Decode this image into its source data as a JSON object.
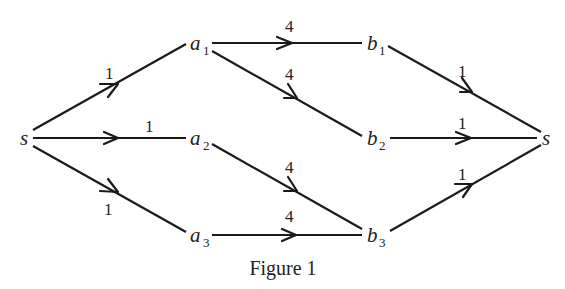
{
  "figure": {
    "caption": "Figure 1",
    "nodes": [
      {
        "id": "s_left",
        "name": "s",
        "sub": "",
        "x": 25,
        "y": 138
      },
      {
        "id": "a1",
        "name": "a",
        "sub": "1",
        "x": 193,
        "y": 43
      },
      {
        "id": "a2",
        "name": "a",
        "sub": "2",
        "x": 193,
        "y": 138
      },
      {
        "id": "a3",
        "name": "a",
        "sub": "3",
        "x": 193,
        "y": 235
      },
      {
        "id": "b1",
        "name": "b",
        "sub": "1",
        "x": 368,
        "y": 43
      },
      {
        "id": "b2",
        "name": "b",
        "sub": "2",
        "x": 368,
        "y": 138
      },
      {
        "id": "b3",
        "name": "b",
        "sub": "3",
        "x": 368,
        "y": 235
      },
      {
        "id": "s_right",
        "name": "s",
        "sub": "",
        "x": 545,
        "y": 138
      }
    ],
    "edges": [
      {
        "from": "s_left",
        "to": "a1",
        "weight": "1"
      },
      {
        "from": "s_left",
        "to": "a2",
        "weight": "1"
      },
      {
        "from": "s_left",
        "to": "a3",
        "weight": "1"
      },
      {
        "from": "a1",
        "to": "b1",
        "weight": "4"
      },
      {
        "from": "a1",
        "to": "b2",
        "weight": "4"
      },
      {
        "from": "a2",
        "to": "b3",
        "weight": "4"
      },
      {
        "from": "a3",
        "to": "b3",
        "weight": "4"
      },
      {
        "from": "b1",
        "to": "s_right",
        "weight": "1"
      },
      {
        "from": "b2",
        "to": "s_right",
        "weight": "1"
      },
      {
        "from": "b3",
        "to": "s_right",
        "weight": "1"
      }
    ]
  }
}
